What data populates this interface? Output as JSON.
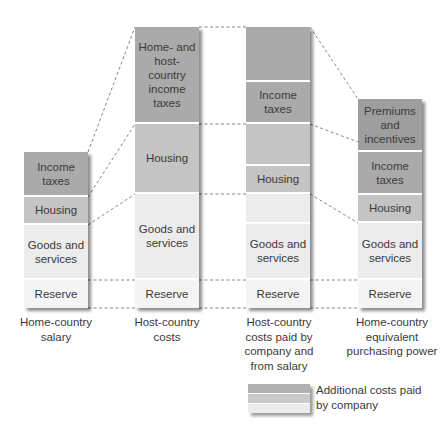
{
  "columns": [
    {
      "label": "Home-country salary",
      "segments": [
        {
          "name": "income-taxes",
          "text": "Income taxes"
        },
        {
          "name": "housing",
          "text": "Housing"
        },
        {
          "name": "goods-services",
          "text": "Goods and services"
        },
        {
          "name": "reserve",
          "text": "Reserve"
        }
      ]
    },
    {
      "label": "Host-country costs",
      "segments": [
        {
          "name": "income-taxes",
          "text": "Home- and host- country income taxes"
        },
        {
          "name": "housing",
          "text": "Housing"
        },
        {
          "name": "goods-services",
          "text": "Goods and services"
        },
        {
          "name": "reserve",
          "text": "Reserve"
        }
      ]
    },
    {
      "label": "Host-country costs paid by company and from salary",
      "segments": [
        {
          "name": "additional-taxes",
          "text": ""
        },
        {
          "name": "income-taxes",
          "text": "Income taxes"
        },
        {
          "name": "additional-housing",
          "text": ""
        },
        {
          "name": "housing",
          "text": "Housing"
        },
        {
          "name": "additional-goods",
          "text": ""
        },
        {
          "name": "goods-services",
          "text": "Goods and services"
        },
        {
          "name": "reserve",
          "text": "Reserve"
        }
      ]
    },
    {
      "label": "Home-country equivalent purchasing power",
      "segments": [
        {
          "name": "premiums",
          "text": "Premiums and incentives"
        },
        {
          "name": "income-taxes",
          "text": "Income taxes"
        },
        {
          "name": "housing",
          "text": "Housing"
        },
        {
          "name": "goods-services",
          "text": "Goods and services"
        },
        {
          "name": "reserve",
          "text": "Reserve"
        }
      ]
    }
  ],
  "legend": {
    "text": "Additional costs paid by company"
  }
}
